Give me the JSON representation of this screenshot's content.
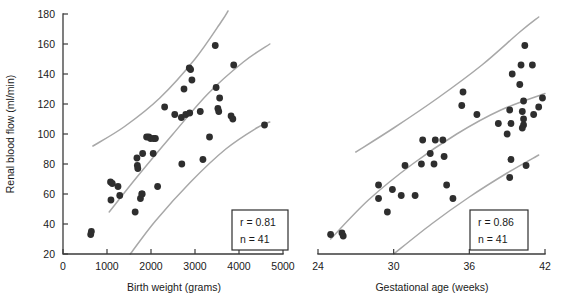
{
  "chart_data": [
    {
      "type": "scatter",
      "panel": "left",
      "title": "",
      "xlabel": "Birth weight (grams)",
      "ylabel": "Renal blood flow (ml/min)",
      "xlim": [
        0,
        5000
      ],
      "ylim": [
        20,
        180
      ],
      "xticks": [
        0,
        1000,
        2000,
        3000,
        4000,
        5000
      ],
      "yticks": [
        20,
        40,
        60,
        80,
        100,
        120,
        140,
        160,
        180
      ],
      "grid": false,
      "legend": "none",
      "annotations": {
        "r_label": "r = 0.81",
        "n_label": "n = 41"
      },
      "points": [
        {
          "x": 630,
          "y": 33
        },
        {
          "x": 645,
          "y": 35
        },
        {
          "x": 1080,
          "y": 68
        },
        {
          "x": 1120,
          "y": 67
        },
        {
          "x": 1090,
          "y": 56
        },
        {
          "x": 1250,
          "y": 65
        },
        {
          "x": 1290,
          "y": 59
        },
        {
          "x": 1640,
          "y": 48
        },
        {
          "x": 1680,
          "y": 84
        },
        {
          "x": 1690,
          "y": 79
        },
        {
          "x": 1700,
          "y": 77
        },
        {
          "x": 1760,
          "y": 57
        },
        {
          "x": 1790,
          "y": 60
        },
        {
          "x": 1800,
          "y": 60
        },
        {
          "x": 1810,
          "y": 87
        },
        {
          "x": 1900,
          "y": 98
        },
        {
          "x": 1950,
          "y": 98
        },
        {
          "x": 1990,
          "y": 97
        },
        {
          "x": 2050,
          "y": 87
        },
        {
          "x": 2060,
          "y": 97
        },
        {
          "x": 2100,
          "y": 97
        },
        {
          "x": 2150,
          "y": 65
        },
        {
          "x": 2310,
          "y": 118
        },
        {
          "x": 2540,
          "y": 113
        },
        {
          "x": 2690,
          "y": 111
        },
        {
          "x": 2700,
          "y": 80
        },
        {
          "x": 2750,
          "y": 130
        },
        {
          "x": 2790,
          "y": 113
        },
        {
          "x": 2880,
          "y": 114
        },
        {
          "x": 2870,
          "y": 144
        },
        {
          "x": 2900,
          "y": 143
        },
        {
          "x": 2930,
          "y": 136
        },
        {
          "x": 3120,
          "y": 115
        },
        {
          "x": 3180,
          "y": 83
        },
        {
          "x": 3330,
          "y": 98
        },
        {
          "x": 3460,
          "y": 159
        },
        {
          "x": 3480,
          "y": 131
        },
        {
          "x": 3520,
          "y": 117
        },
        {
          "x": 3540,
          "y": 115
        },
        {
          "x": 3560,
          "y": 124
        },
        {
          "x": 3820,
          "y": 112
        },
        {
          "x": 3860,
          "y": 110
        },
        {
          "x": 3880,
          "y": 146
        },
        {
          "x": 4580,
          "y": 106
        }
      ],
      "reference_curves": [
        {
          "name": "upper-reference-curve",
          "points": [
            [
              680,
              92
            ],
            [
              1400,
              105
            ],
            [
              2200,
              124
            ],
            [
              3000,
              150
            ],
            [
              3600,
              175
            ],
            [
              3750,
              182
            ]
          ]
        },
        {
          "name": "central-reference-curve",
          "points": [
            [
              1050,
              48
            ],
            [
              1700,
              72
            ],
            [
              2500,
              100
            ],
            [
              3300,
              127
            ],
            [
              4100,
              148
            ],
            [
              4700,
              160
            ]
          ]
        },
        {
          "name": "lower-reference-curve",
          "points": [
            [
              1530,
              20
            ],
            [
              2100,
              42
            ],
            [
              2900,
              68
            ],
            [
              3700,
              90
            ],
            [
              4400,
              104
            ],
            [
              4700,
              108
            ]
          ]
        }
      ]
    },
    {
      "type": "scatter",
      "panel": "right",
      "title": "",
      "xlabel": "Gestational age (weeks)",
      "ylabel": "Renal blood flow (ml/min)",
      "xlim": [
        24,
        42
      ],
      "ylim": [
        20,
        180
      ],
      "xticks": [
        24,
        30,
        36,
        42
      ],
      "yticks": [
        20,
        40,
        60,
        80,
        100,
        120,
        140,
        160,
        180
      ],
      "grid": false,
      "legend": "none",
      "annotations": {
        "r_label": "r = 0.86",
        "n_label": "n = 41"
      },
      "points": [
        {
          "x": 25.0,
          "y": 33
        },
        {
          "x": 25.9,
          "y": 34
        },
        {
          "x": 26.0,
          "y": 32
        },
        {
          "x": 28.8,
          "y": 66
        },
        {
          "x": 28.8,
          "y": 57
        },
        {
          "x": 29.5,
          "y": 48
        },
        {
          "x": 29.9,
          "y": 63
        },
        {
          "x": 30.6,
          "y": 59
        },
        {
          "x": 30.9,
          "y": 79
        },
        {
          "x": 31.7,
          "y": 59
        },
        {
          "x": 32.2,
          "y": 80
        },
        {
          "x": 32.3,
          "y": 96
        },
        {
          "x": 32.9,
          "y": 87
        },
        {
          "x": 33.2,
          "y": 80
        },
        {
          "x": 33.3,
          "y": 96
        },
        {
          "x": 33.9,
          "y": 96
        },
        {
          "x": 34.0,
          "y": 85
        },
        {
          "x": 34.2,
          "y": 66
        },
        {
          "x": 34.7,
          "y": 57
        },
        {
          "x": 35.4,
          "y": 119
        },
        {
          "x": 35.5,
          "y": 128
        },
        {
          "x": 36.6,
          "y": 113
        },
        {
          "x": 38.3,
          "y": 107
        },
        {
          "x": 39.0,
          "y": 100
        },
        {
          "x": 39.2,
          "y": 116
        },
        {
          "x": 39.3,
          "y": 107
        },
        {
          "x": 39.4,
          "y": 140
        },
        {
          "x": 39.3,
          "y": 83
        },
        {
          "x": 39.2,
          "y": 71
        },
        {
          "x": 40.0,
          "y": 133
        },
        {
          "x": 40.1,
          "y": 146
        },
        {
          "x": 40.2,
          "y": 115
        },
        {
          "x": 40.3,
          "y": 110
        },
        {
          "x": 40.3,
          "y": 106
        },
        {
          "x": 40.2,
          "y": 104
        },
        {
          "x": 40.3,
          "y": 122
        },
        {
          "x": 40.4,
          "y": 159
        },
        {
          "x": 40.5,
          "y": 79
        },
        {
          "x": 41.0,
          "y": 146
        },
        {
          "x": 41.1,
          "y": 113
        },
        {
          "x": 41.5,
          "y": 118
        },
        {
          "x": 41.8,
          "y": 124
        }
      ],
      "reference_curves": [
        {
          "name": "upper-reference-curve",
          "points": [
            [
              27.0,
              88
            ],
            [
              30.0,
              104
            ],
            [
              33.5,
              124
            ],
            [
              37.0,
              146
            ],
            [
              40.0,
              168
            ],
            [
              41.5,
              178
            ]
          ]
        },
        {
          "name": "central-reference-curve",
          "points": [
            [
              25.0,
              30
            ],
            [
              28.0,
              56
            ],
            [
              31.5,
              80
            ],
            [
              35.0,
              100
            ],
            [
              38.5,
              116
            ],
            [
              42.0,
              127
            ]
          ]
        },
        {
          "name": "lower-reference-curve",
          "points": [
            [
              30.0,
              20
            ],
            [
              33.0,
              40
            ],
            [
              36.0,
              58
            ],
            [
              39.0,
              74
            ],
            [
              41.5,
              86
            ]
          ]
        }
      ]
    }
  ],
  "figure": {
    "background_color": "#ffffff",
    "point_color": "#2e2e2e",
    "curve_color": "#a8a8a8",
    "axis_color": "#3b3b3b"
  }
}
